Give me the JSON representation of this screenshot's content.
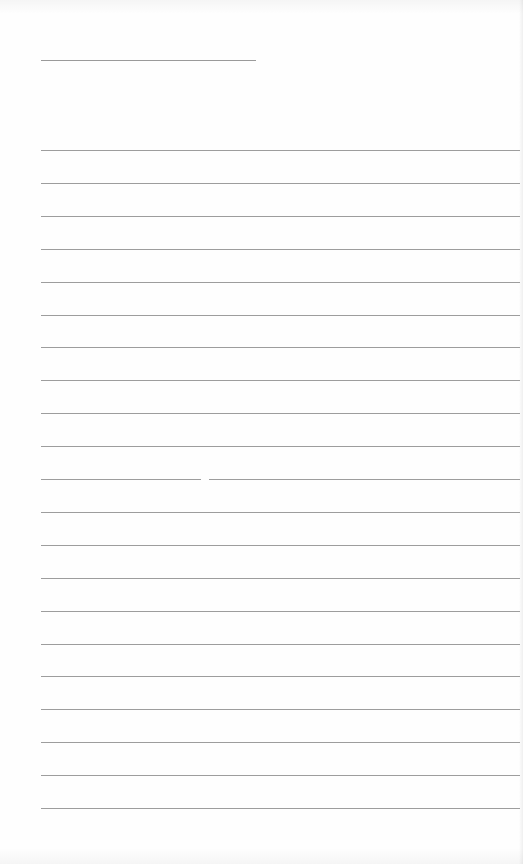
{
  "document": {
    "type": "lined-writing-paper",
    "title_field": {
      "value": "",
      "line": {
        "x": 41,
        "y": 60,
        "width": 215
      }
    },
    "ruled_lines": {
      "count": 21,
      "start_y": 150,
      "spacing": 32.9,
      "x_start": 41,
      "x_end": 520,
      "values": [
        "",
        "",
        "",
        "",
        "",
        "",
        "",
        "",
        "",
        "",
        "",
        "",
        "",
        "",
        "",
        "",
        "",
        "",
        "",
        "",
        ""
      ]
    },
    "colors": {
      "paper": "#fefefe",
      "rule": "#9d9d9d"
    }
  }
}
